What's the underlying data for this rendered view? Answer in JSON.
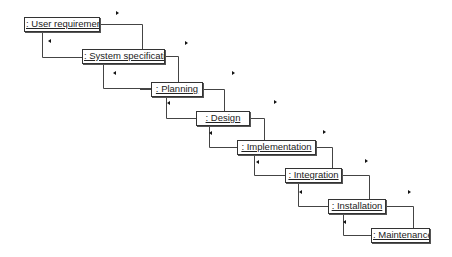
{
  "diagram": {
    "type": "UML collaboration / waterfall",
    "objects": [
      {
        "id": "user-requirements",
        "label": ": User requirements",
        "x": 24,
        "y": 17,
        "w": 76,
        "h": 15
      },
      {
        "id": "system-specification",
        "label": ": System specification",
        "x": 82,
        "y": 49,
        "w": 83,
        "h": 15
      },
      {
        "id": "planning",
        "label": ": Planning",
        "x": 151,
        "y": 82,
        "w": 52,
        "h": 15
      },
      {
        "id": "design",
        "label": ": Design",
        "x": 196,
        "y": 111,
        "w": 54,
        "h": 15
      },
      {
        "id": "implementation",
        "label": ": Implementation",
        "x": 237,
        "y": 140,
        "w": 79,
        "h": 15
      },
      {
        "id": "integration",
        "label": ": Integration",
        "x": 285,
        "y": 168,
        "w": 57,
        "h": 15
      },
      {
        "id": "installation",
        "label": ": Installation",
        "x": 328,
        "y": 199,
        "w": 58,
        "h": 15
      },
      {
        "id": "maintenance",
        "label": ": Maintenance",
        "x": 371,
        "y": 228,
        "w": 59,
        "h": 15
      }
    ],
    "links": [
      {
        "from": "user-requirements",
        "to": "system-specification",
        "forward_arrow": {
          "x": 117,
          "y": 13
        },
        "back_arrow": {
          "x": 49,
          "y": 41
        }
      },
      {
        "from": "system-specification",
        "to": "planning",
        "forward_arrow": {
          "x": 186,
          "y": 43
        },
        "back_arrow": {
          "x": 114,
          "y": 73
        }
      },
      {
        "from": "planning",
        "to": "design",
        "forward_arrow": {
          "x": 232,
          "y": 73
        },
        "back_arrow": {
          "x": 168,
          "y": 103
        }
      },
      {
        "from": "design",
        "to": "implementation",
        "forward_arrow": {
          "x": 274,
          "y": 102
        },
        "back_arrow": {
          "x": 210,
          "y": 133
        }
      },
      {
        "from": "implementation",
        "to": "integration",
        "forward_arrow": {
          "x": 323,
          "y": 132
        },
        "back_arrow": {
          "x": 257,
          "y": 162
        }
      },
      {
        "from": "integration",
        "to": "installation",
        "forward_arrow": {
          "x": 365,
          "y": 161
        },
        "back_arrow": {
          "x": 300,
          "y": 192
        }
      },
      {
        "from": "installation",
        "to": "maintenance",
        "forward_arrow": {
          "x": 408,
          "y": 192
        },
        "back_arrow": {
          "x": 344,
          "y": 222
        }
      }
    ]
  }
}
